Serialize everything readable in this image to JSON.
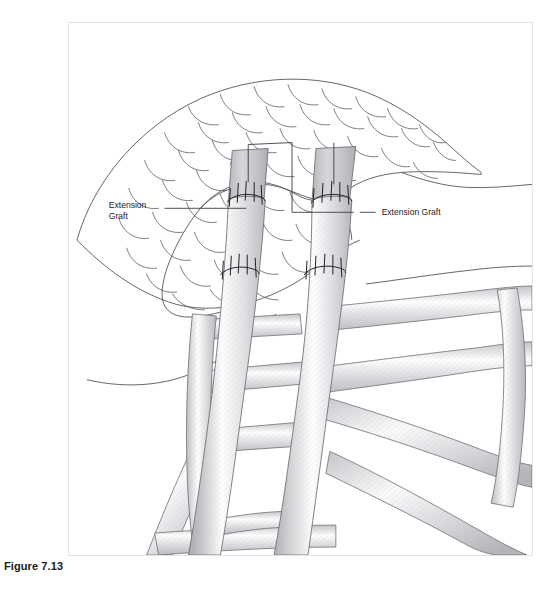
{
  "figure": {
    "caption": "Figure 7.13",
    "kind": "anatomical-line-illustration"
  },
  "panel": {
    "border_color": "#e3e3e3",
    "background": "#ffffff",
    "x": 68,
    "y": 22,
    "width": 465,
    "height": 534
  },
  "annotations": [
    {
      "id": "left-label",
      "line1": "Extension",
      "line2": "Graft",
      "text_x": 100,
      "text_y": 189,
      "leader": "M 155 190 L 188 190 L 266 190"
    },
    {
      "id": "right-label",
      "line1": "Extension Graft",
      "line2": "",
      "text_x": 358,
      "text_y": 192,
      "leader": "M 330 190 L 352 190"
    }
  ],
  "colors": {
    "outline": "#4a4a52",
    "texture_line": "#5a5a62",
    "graft_fill_light": "#ffffff",
    "graft_fill_mid": "#d2d2d4",
    "graft_fill_dark": "#b4b4b8",
    "network_fill": "#d0d0d2",
    "suture_line": "#1f1f24",
    "leader_line": "#3c3c42",
    "label_text": "#1c1c1c",
    "caption_text": "#1a1a1a"
  },
  "structures": {
    "cartilage_mass_label": "scalloped cartilage mass",
    "graft_strips_count": 2,
    "suture_junctions_per_graft": 2,
    "suture_ticks_per_junction": 5,
    "network_label": "reticular cartilage framework"
  }
}
